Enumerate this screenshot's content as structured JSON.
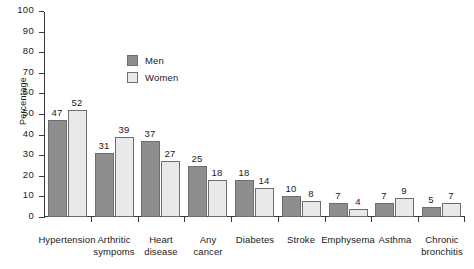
{
  "chart_data": {
    "type": "bar",
    "title": "",
    "xlabel": "",
    "ylabel": "Percentage",
    "ylim": [
      0,
      100
    ],
    "ytick_step": 10,
    "yticks": [
      0,
      10,
      20,
      30,
      40,
      50,
      60,
      70,
      80,
      90,
      100
    ],
    "grid": false,
    "legend_position": "inside-upper-left",
    "categories": [
      "Hypertension",
      "Arthritic sympoms",
      "Heart disease",
      "Any cancer",
      "Diabetes",
      "Stroke",
      "Emphysema",
      "Asthma",
      "Chronic bronchitis"
    ],
    "category_lines": [
      [
        "Hypertension"
      ],
      [
        "Arthritic",
        "sympoms"
      ],
      [
        "Heart",
        "disease"
      ],
      [
        "Any",
        "cancer"
      ],
      [
        "Diabetes"
      ],
      [
        "Stroke"
      ],
      [
        "Emphysema"
      ],
      [
        "Asthma"
      ],
      [
        "Chronic",
        "bronchitis"
      ]
    ],
    "series": [
      {
        "name": "Men",
        "color": "#8e8e8e",
        "values": [
          47,
          31,
          37,
          25,
          18,
          10,
          7,
          7,
          5
        ]
      },
      {
        "name": "Women",
        "color": "#e9e9e9",
        "values": [
          52,
          39,
          27,
          18,
          14,
          8,
          4,
          9,
          7
        ]
      }
    ]
  },
  "colors": {
    "men": "#8e8e8e",
    "women": "#e9e9e9",
    "bar_border": "#6e6e6e",
    "axis": "#3a3a3a",
    "text": "#1a1a1a",
    "background": "#ffffff"
  }
}
